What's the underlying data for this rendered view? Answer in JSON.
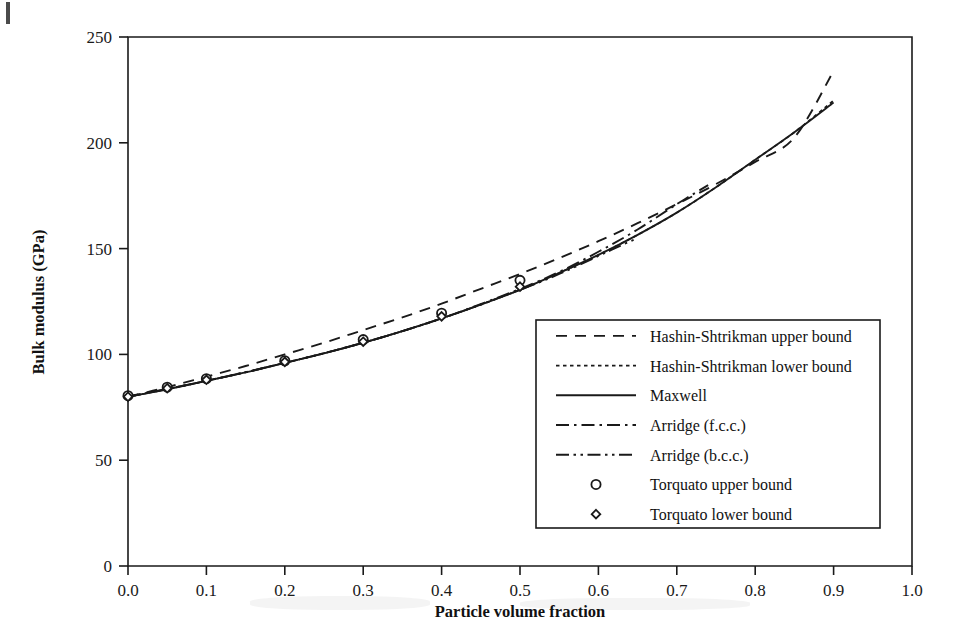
{
  "chart_data": {
    "type": "line",
    "title": "",
    "xlabel": "Particle volume fraction",
    "ylabel": "Bulk modulus (GPa)",
    "xlim": [
      0.0,
      1.0
    ],
    "ylim": [
      0,
      250
    ],
    "xticks": [
      "0.0",
      "0.1",
      "0.2",
      "0.3",
      "0.4",
      "0.5",
      "0.6",
      "0.7",
      "0.8",
      "0.9",
      "1.0"
    ],
    "xtick_values": [
      0.0,
      0.1,
      0.2,
      0.3,
      0.4,
      0.5,
      0.6,
      0.7,
      0.8,
      0.9,
      1.0
    ],
    "yticks": [
      "0",
      "50",
      "100",
      "150",
      "200",
      "250"
    ],
    "ytick_values": [
      0,
      50,
      100,
      150,
      200,
      250
    ],
    "grid": false,
    "legend_position": "inside-lower-right",
    "series": [
      {
        "name": "Hashin-Shtrikman upper bound",
        "style": "dashed",
        "x": [
          0.0,
          0.05,
          0.1,
          0.15,
          0.2,
          0.25,
          0.3,
          0.35,
          0.4,
          0.45,
          0.5,
          0.55,
          0.6,
          0.65,
          0.7,
          0.75,
          0.8,
          0.85,
          0.9
        ],
        "y": [
          80,
          84.5,
          89.5,
          94.5,
          100,
          105.5,
          111.5,
          117.5,
          124,
          131,
          138,
          145.5,
          153.5,
          162,
          171,
          180.5,
          191,
          202.5,
          234
        ]
      },
      {
        "name": "Hashin-Shtrikman lower bound",
        "style": "dotted",
        "x": [
          0.0,
          0.05,
          0.1,
          0.15,
          0.2,
          0.25,
          0.3,
          0.35,
          0.4,
          0.45,
          0.5,
          0.55,
          0.6,
          0.65,
          0.7,
          0.75,
          0.8,
          0.85,
          0.9
        ],
        "y": [
          80,
          83.5,
          87.5,
          91.5,
          96,
          100.5,
          105.5,
          111,
          117,
          123.5,
          130.5,
          138.5,
          147,
          156.5,
          167,
          179,
          192,
          205,
          220
        ]
      },
      {
        "name": "Maxwell",
        "style": "solid",
        "x": [
          0.0,
          0.05,
          0.1,
          0.15,
          0.2,
          0.25,
          0.3,
          0.35,
          0.4,
          0.45,
          0.5,
          0.55,
          0.6,
          0.65,
          0.7,
          0.75,
          0.8,
          0.85,
          0.9
        ],
        "y": [
          80,
          83.5,
          87.5,
          91.5,
          96,
          100.5,
          105.5,
          111,
          117,
          123.5,
          130.5,
          138.5,
          147,
          156.5,
          167,
          179,
          192,
          205,
          219
        ]
      },
      {
        "name": "Arridge (f.c.c.)",
        "style": "dash-dot",
        "x": [
          0.0,
          0.1,
          0.2,
          0.3,
          0.4,
          0.5,
          0.55,
          0.6,
          0.65,
          0.7,
          0.74
        ],
        "y": [
          80,
          87.5,
          96,
          105.5,
          117,
          131,
          139,
          148.5,
          159,
          171,
          180
        ]
      },
      {
        "name": "Arridge (b.c.c.)",
        "style": "dash-dot-dot",
        "x": [
          0.0,
          0.1,
          0.2,
          0.3,
          0.4,
          0.5,
          0.55,
          0.6,
          0.62,
          0.65
        ],
        "y": [
          80,
          87.5,
          96,
          105.5,
          117,
          130.5,
          138,
          146.5,
          150,
          155
        ]
      },
      {
        "name": "Torquato upper bound",
        "style": "marker-circle",
        "x": [
          0.0,
          0.05,
          0.1,
          0.2,
          0.3,
          0.4,
          0.5
        ],
        "y": [
          80.5,
          84.5,
          88.5,
          97,
          107,
          119.5,
          135
        ]
      },
      {
        "name": "Torquato lower bound",
        "style": "marker-diamond",
        "x": [
          0.0,
          0.05,
          0.1,
          0.2,
          0.3,
          0.4,
          0.5
        ],
        "y": [
          80,
          84,
          88,
          96.5,
          106,
          118,
          132
        ]
      }
    ]
  },
  "legend": {
    "entries": [
      {
        "label": "Hashin-Shtrikman upper bound",
        "style": "dashed"
      },
      {
        "label": "Hashin-Shtrikman lower bound",
        "style": "dotted"
      },
      {
        "label": "Maxwell",
        "style": "solid"
      },
      {
        "label": "Arridge (f.c.c.)",
        "style": "dash-dot"
      },
      {
        "label": "Arridge (b.c.c.)",
        "style": "dash-dot-dot"
      },
      {
        "label": "Torquato  upper bound",
        "style": "marker-circle"
      },
      {
        "label": "Torquato lower bound",
        "style": "marker-diamond"
      }
    ]
  }
}
